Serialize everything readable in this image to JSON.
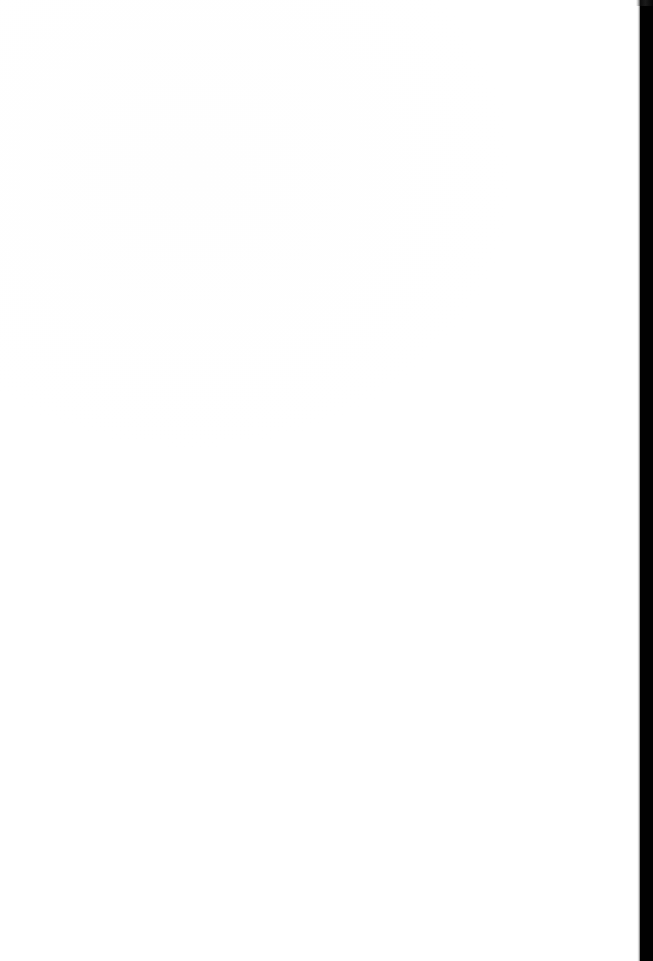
{
  "page": {
    "kind": "scanned-document-page",
    "orientation": "portrait",
    "width_px": 653,
    "height_px": 961,
    "content_text": "",
    "is_blank": true,
    "visible_text_blocks": [],
    "page_number_label": "",
    "header_text": "",
    "footer_text": ""
  },
  "colors": {
    "paper": "#ffffff",
    "paper_tint": "#fefefe",
    "scanner_gutter": "#010101",
    "edge_shadow_gray": "#96989e",
    "smudge_gray": "#787a80",
    "speck_gray": "#c4c6cb"
  },
  "artifacts": {
    "right_gutter": {
      "name": "scanner-gutter",
      "edge": "right",
      "x_start_px": 640,
      "width_px": 13,
      "color": "#010101"
    },
    "top_edge_shadow": {
      "name": "top-edge-shadow",
      "edge": "top",
      "height_px": 4
    },
    "left_edge_line": {
      "name": "left-edge-line",
      "edge": "left",
      "x_px": 2,
      "width_px": 2
    },
    "bottom_smudge": {
      "name": "bottom-smudge",
      "edge": "bottom",
      "x_px": 338,
      "width_px": 116,
      "height_px": 7
    },
    "speck": {
      "name": "speck-artifact",
      "x_px": 487,
      "y_px": 356,
      "size_px": 4
    }
  }
}
